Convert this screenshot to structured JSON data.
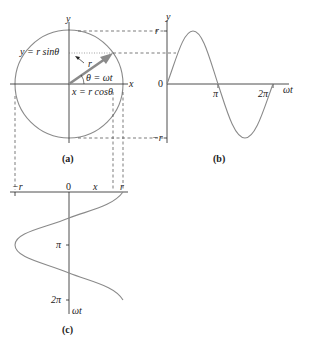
{
  "figure": {
    "panel_a": {
      "caption": "(a)",
      "axis_x_label": "x",
      "axis_y_label": "y",
      "vector_label": "r⃗",
      "y_eq": "y = r sinθ",
      "x_eq": "x = r cosθ",
      "theta_eq": "θ = ωt",
      "radius_px": 54,
      "angle_deg": 35
    },
    "panel_b": {
      "caption": "(b)",
      "axis_y_label": "y",
      "axis_x_label": "ωt",
      "tick_r": "r",
      "tick_neg_r": "−r",
      "tick_zero": "0",
      "tick_pi": "π",
      "tick_2pi": "2π",
      "function": "y = r sin(ωt)"
    },
    "panel_c": {
      "caption": "(c)",
      "axis_x_label": "x",
      "axis_y_label": "ωt",
      "tick_neg_r": "−r",
      "tick_zero": "0",
      "tick_r": "r",
      "tick_pi": "π",
      "tick_2pi": "2π",
      "function": "x = r cos(ωt)"
    },
    "colors": {
      "curve": "#8a8a8a",
      "axis": "#222222",
      "arrow": "#8a8a8a",
      "dash": "#444444"
    }
  }
}
